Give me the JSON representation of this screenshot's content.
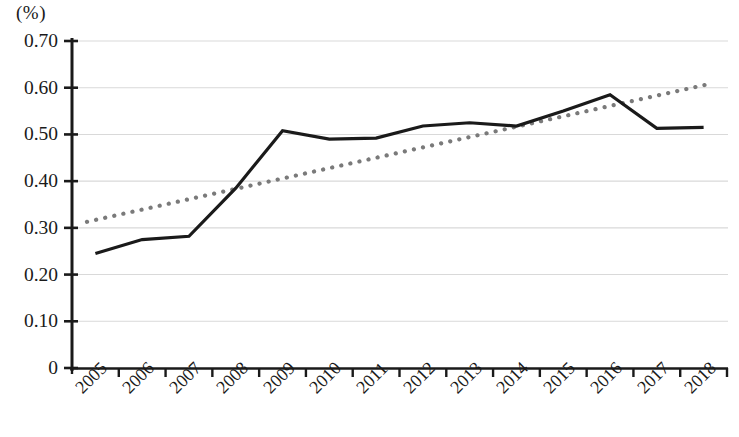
{
  "chart_data": {
    "type": "line",
    "title": "",
    "subtitle": "",
    "xlabel": "",
    "ylabel": "(%)",
    "unit_label": "(%)",
    "categories": [
      "2005",
      "2006",
      "2007",
      "2008",
      "2009",
      "2010",
      "2011",
      "2012",
      "2013",
      "2014",
      "2015",
      "2016",
      "2017",
      "2018"
    ],
    "ylim": [
      0,
      0.7
    ],
    "ytick_labels": [
      "0.70",
      "0.60",
      "0.50",
      "0.40",
      "0.30",
      "0.20",
      "0.10",
      "0"
    ],
    "ytick_values": [
      0.7,
      0.6,
      0.5,
      0.4,
      0.3,
      0.2,
      0.1,
      0
    ],
    "grid": "horizontal",
    "legend": "none",
    "legend_position": "none",
    "series": [
      {
        "name": "data",
        "style": "solid",
        "color": "#1a1a1a",
        "values": [
          0.245,
          0.275,
          0.282,
          0.385,
          0.508,
          0.49,
          0.492,
          0.518,
          0.525,
          0.518,
          0.55,
          0.585,
          0.513,
          0.515
        ]
      },
      {
        "name": "trendline",
        "style": "dotted",
        "color": "#7a7a7a",
        "values": [
          0.313,
          0.336,
          0.358,
          0.381,
          0.404,
          0.427,
          0.45,
          0.473,
          0.496,
          0.519,
          0.542,
          0.565,
          0.588,
          0.608
        ]
      }
    ],
    "trendline": {
      "type": "linear",
      "start_value": 0.313,
      "end_value": 0.608,
      "style": "dotted",
      "color": "#7a7a7a"
    }
  },
  "axes": {
    "y_axis_color": "#1a1a1a",
    "x_axis_color": "#1a1a1a",
    "gridline_color": "#d9d9d9",
    "tick_label_rotation": -45
  }
}
